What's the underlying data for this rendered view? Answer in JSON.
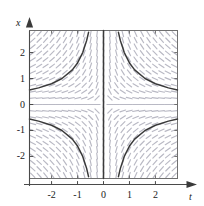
{
  "figure": {
    "name": "slope-field-plot",
    "axes": {
      "x_axis_label": "t",
      "y_axis_label": "x",
      "arrow_heads": true
    },
    "colors": {
      "frame": "#6f6f6f",
      "axis": "#4a4a4a",
      "curve": "#3a3a3a",
      "slope_mark": "#b9b9c4",
      "background": "#ffffff",
      "text": "#1a1a1a"
    }
  },
  "chart_data": {
    "type": "line",
    "title": "",
    "subtitle": "",
    "xlabel": "t",
    "ylabel": "x",
    "xlim": [
      -2.85,
      2.85
    ],
    "ylim": [
      -2.85,
      2.85
    ],
    "xticks": [
      -2,
      -1,
      0,
      1,
      2
    ],
    "yticks": [
      -2,
      -1,
      0,
      1,
      2
    ],
    "xticklabels": [
      "-2",
      "-1",
      "0",
      "1",
      "2"
    ],
    "yticklabels": [
      "-2",
      "-1",
      "0",
      "1",
      "2"
    ],
    "grid": false,
    "legend": "none",
    "equation": "dx/dt = -x/t",
    "field": {
      "type": "slope-field",
      "description": "direction field of dx/dt = -x/t drawn as short gray dashes",
      "grid_cols": 23,
      "grid_rows": 23,
      "mark_length": 6
    },
    "series": [
      {
        "name": "hyperbola-branch-upper-left",
        "curve": "x = 1.60 / (-t)",
        "constant": -1.6,
        "quadrant": "upper-left",
        "points": [
          {
            "t": -2.85,
            "x": 0.561
          },
          {
            "t": -2.5,
            "x": 0.64
          },
          {
            "t": -2.0,
            "x": 0.8
          },
          {
            "t": -1.6,
            "x": 1.0
          },
          {
            "t": -1.2,
            "x": 1.333
          },
          {
            "t": -1.0,
            "x": 1.6
          },
          {
            "t": -0.8,
            "x": 2.0
          },
          {
            "t": -0.65,
            "x": 2.46
          },
          {
            "t": -0.575,
            "x": 2.78
          }
        ]
      },
      {
        "name": "hyperbola-branch-upper-right",
        "curve": "x = 1.60 / t",
        "constant": 1.6,
        "quadrant": "upper-right",
        "points": [
          {
            "t": 0.575,
            "x": 2.78
          },
          {
            "t": 0.65,
            "x": 2.46
          },
          {
            "t": 0.8,
            "x": 2.0
          },
          {
            "t": 1.0,
            "x": 1.6
          },
          {
            "t": 1.2,
            "x": 1.333
          },
          {
            "t": 1.6,
            "x": 1.0
          },
          {
            "t": 2.0,
            "x": 0.8
          },
          {
            "t": 2.5,
            "x": 0.64
          },
          {
            "t": 2.85,
            "x": 0.561
          }
        ]
      },
      {
        "name": "hyperbola-branch-lower-left",
        "curve": "x = -1.60 / (-t)",
        "constant": 1.6,
        "quadrant": "lower-left",
        "points": [
          {
            "t": -2.85,
            "x": -0.561
          },
          {
            "t": -2.5,
            "x": -0.64
          },
          {
            "t": -2.0,
            "x": -0.8
          },
          {
            "t": -1.6,
            "x": -1.0
          },
          {
            "t": -1.2,
            "x": -1.333
          },
          {
            "t": -1.0,
            "x": -1.6
          },
          {
            "t": -0.8,
            "x": -2.0
          },
          {
            "t": -0.65,
            "x": -2.46
          },
          {
            "t": -0.575,
            "x": -2.78
          }
        ]
      },
      {
        "name": "hyperbola-branch-lower-right",
        "curve": "x = -1.60 / t",
        "constant": -1.6,
        "quadrant": "lower-right",
        "points": [
          {
            "t": 0.575,
            "x": -2.78
          },
          {
            "t": 0.65,
            "x": -2.46
          },
          {
            "t": 0.8,
            "x": -2.0
          },
          {
            "t": 1.0,
            "x": -1.6
          },
          {
            "t": 1.2,
            "x": -1.333
          },
          {
            "t": 1.6,
            "x": -1.0
          },
          {
            "t": 2.0,
            "x": -0.8
          },
          {
            "t": 2.5,
            "x": -0.64
          },
          {
            "t": 2.85,
            "x": -0.561
          }
        ]
      },
      {
        "name": "vertical-asymptote",
        "curve": "t = 0",
        "quadrant": "center",
        "points": [
          {
            "t": 0,
            "x": 2.85
          },
          {
            "t": 0,
            "x": -2.85
          }
        ]
      }
    ]
  }
}
